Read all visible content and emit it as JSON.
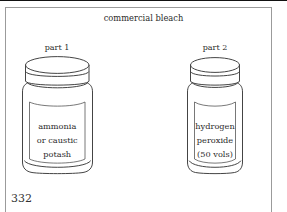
{
  "page": {
    "number": "332",
    "background_color": "#ffffff",
    "ink_color": "#2f2f2f"
  },
  "figure": {
    "title": "commercial bleach",
    "frame_color": "#9b9b9b",
    "jars": [
      {
        "part_label": "part 1",
        "label_lines": [
          "ammonia",
          "or caustic",
          "potash"
        ],
        "name": "ammonia-or-caustic-potash-jar"
      },
      {
        "part_label": "part 2",
        "label_lines": [
          "hydrogen",
          "peroxide",
          "(50 vols)"
        ],
        "name": "hydrogen-peroxide-jar"
      }
    ]
  }
}
